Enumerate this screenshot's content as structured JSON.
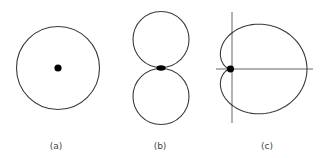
{
  "figure": {
    "panels": [
      {
        "id": "a",
        "label": "(a)",
        "shape": "circle centered on dot",
        "center": [
          58,
          68
        ],
        "radius": 42
      },
      {
        "id": "b",
        "label": "(b)",
        "shape": "figure-eight (two tangent circles, dipole pattern)",
        "center": [
          161,
          68
        ],
        "lobe_radius": 28
      },
      {
        "id": "c",
        "label": "(c)",
        "shape": "cardioid with axes",
        "cusp": [
          230,
          69
        ]
      }
    ],
    "colors": {
      "stroke": "#3a3a3a",
      "dot": "#000000",
      "background": "#ffffff"
    }
  }
}
